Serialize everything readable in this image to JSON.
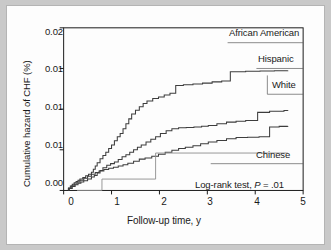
{
  "figure": {
    "background_color": "#fdfdfd",
    "frame_color": "#b4b4b4",
    "page_color": "#c9c9c9",
    "axis_color": "#1a1a1a"
  },
  "chart_data": {
    "type": "line",
    "title": "",
    "subtitle": "",
    "xlabel": "Follow-up time, y",
    "ylabel": "Cumulative hazard of CHF (%)",
    "xlim": [
      0,
      5
    ],
    "ylim": [
      0.0,
      0.02
    ],
    "xticks": [
      "0",
      "1",
      "2",
      "3",
      "4",
      "5"
    ],
    "xtick_values": [
      0,
      1,
      2,
      3,
      4,
      5
    ],
    "yticks": [
      "0.00",
      "0.01",
      "0.01",
      "0.01",
      "0.02"
    ],
    "ytick_values": [
      0.0,
      0.005,
      0.01,
      0.015,
      0.02
    ],
    "grid": false,
    "legend_position": "inline-right-of-curve-ends",
    "step_style": "post",
    "annotation": "Log-rank test, P = .01",
    "annotation_stat": "P",
    "annotation_prefix": "Log-rank test, ",
    "annotation_suffix": " = .01",
    "series": [
      {
        "name": "African American",
        "label": "African American",
        "color": "#3d3d3d",
        "end_value": 0.01475,
        "x": [
          0.1,
          0.14,
          0.18,
          0.22,
          0.26,
          0.3,
          0.34,
          0.4,
          0.46,
          0.52,
          0.58,
          0.62,
          0.66,
          0.7,
          0.76,
          0.82,
          0.88,
          0.94,
          1.0,
          1.06,
          1.12,
          1.18,
          1.24,
          1.3,
          1.36,
          1.42,
          1.5,
          1.58,
          1.66,
          1.74,
          1.86,
          1.98,
          2.1,
          2.22,
          2.34,
          2.5,
          2.7,
          2.9,
          3.1,
          3.3,
          3.48,
          3.8,
          4.1,
          4.4,
          4.68
        ],
        "y": [
          0.0003,
          0.00055,
          0.00075,
          0.00095,
          0.0011,
          0.00125,
          0.0014,
          0.0016,
          0.0018,
          0.002,
          0.00225,
          0.0026,
          0.003,
          0.0034,
          0.0039,
          0.0043,
          0.0047,
          0.00515,
          0.0056,
          0.0061,
          0.0066,
          0.007,
          0.0076,
          0.0082,
          0.0088,
          0.0094,
          0.00985,
          0.0103,
          0.0107,
          0.011,
          0.0113,
          0.0115,
          0.01175,
          0.01195,
          0.0129,
          0.013,
          0.0131,
          0.0132,
          0.01335,
          0.01345,
          0.0146,
          0.01465,
          0.0147,
          0.01473,
          0.01475
        ]
      },
      {
        "name": "Hispanic",
        "label": "Hispanic",
        "color": "#3d3d3d",
        "end_value": 0.00985,
        "x": [
          0.12,
          0.18,
          0.24,
          0.3,
          0.36,
          0.42,
          0.5,
          0.58,
          0.64,
          0.7,
          0.76,
          0.82,
          0.9,
          0.98,
          1.06,
          1.14,
          1.22,
          1.3,
          1.38,
          1.46,
          1.54,
          1.62,
          1.72,
          1.82,
          1.92,
          2.02,
          2.14,
          2.26,
          2.4,
          2.56,
          2.72,
          2.88,
          3.02,
          3.2,
          3.4,
          3.6,
          3.8,
          4.05,
          4.3,
          4.6,
          4.68
        ],
        "y": [
          0.00025,
          0.0005,
          0.0007,
          0.0009,
          0.00105,
          0.0012,
          0.0014,
          0.00165,
          0.00185,
          0.00215,
          0.00245,
          0.0028,
          0.0031,
          0.0033,
          0.0035,
          0.0038,
          0.00415,
          0.0044,
          0.0047,
          0.005,
          0.0053,
          0.0056,
          0.00595,
          0.0063,
          0.0066,
          0.007,
          0.00735,
          0.0076,
          0.0077,
          0.00775,
          0.0078,
          0.0079,
          0.008,
          0.0082,
          0.0084,
          0.0085,
          0.0086,
          0.0096,
          0.00975,
          0.00983,
          0.00985
        ]
      },
      {
        "name": "White",
        "label": "White",
        "color": "#3d3d3d",
        "end_value": 0.0079,
        "x": [
          0.1,
          0.16,
          0.22,
          0.28,
          0.34,
          0.42,
          0.5,
          0.58,
          0.66,
          0.74,
          0.84,
          0.94,
          1.04,
          1.14,
          1.24,
          1.34,
          1.46,
          1.58,
          1.7,
          1.84,
          1.98,
          2.12,
          2.26,
          2.4,
          2.54,
          2.7,
          2.86,
          3.02,
          3.2,
          3.4,
          3.6,
          3.84,
          4.08,
          4.3,
          4.5,
          4.68
        ],
        "y": [
          0.00028,
          0.00055,
          0.0008,
          0.00105,
          0.00125,
          0.0015,
          0.00175,
          0.002,
          0.00222,
          0.0024,
          0.00258,
          0.00272,
          0.00285,
          0.003,
          0.00315,
          0.00335,
          0.0036,
          0.00385,
          0.004,
          0.0042,
          0.00445,
          0.0047,
          0.00495,
          0.00515,
          0.0053,
          0.0055,
          0.00575,
          0.00595,
          0.00615,
          0.00635,
          0.0065,
          0.00655,
          0.0066,
          0.0078,
          0.00788,
          0.0079
        ]
      },
      {
        "name": "Chinese",
        "label": "Chinese",
        "color": "#8c8c8c",
        "end_value": 0.0046,
        "x": [
          0.28,
          0.8,
          1.92,
          4.68
        ],
        "y": [
          0.0,
          0.0014,
          0.0046,
          0.0046
        ]
      }
    ],
    "series_labels": [
      {
        "name": "African American",
        "text": "African American",
        "x_px": 232,
        "y_px": 27
      },
      {
        "name": "Hispanic",
        "text": "Hispanic",
        "x_px": 254,
        "y_px": 53
      },
      {
        "name": "White",
        "text": "White",
        "x_px": 268,
        "y_px": 79
      },
      {
        "name": "Chinese",
        "text": "Chinese",
        "x_px": 252,
        "y_px": 149
      }
    ]
  }
}
